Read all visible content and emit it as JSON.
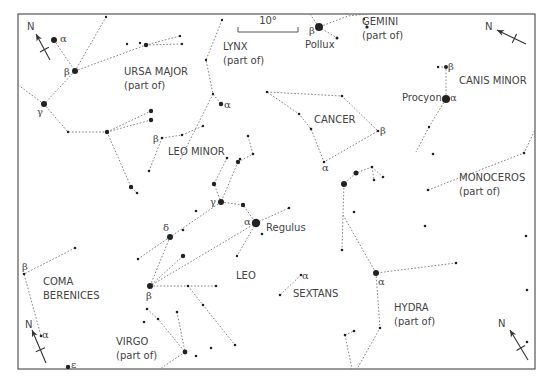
{
  "frame": {
    "x": 18,
    "y": 14,
    "w": 517,
    "h": 355
  },
  "scale_bar": {
    "label": "10°",
    "x1": 238,
    "x2": 298,
    "y": 32
  },
  "compasses": [
    {
      "id": "top-left",
      "label": "N",
      "x1": 50,
      "y1": 60,
      "x2": 36,
      "y2": 34,
      "lx": 27,
      "ly": 30
    },
    {
      "id": "top-right",
      "label": "N",
      "x1": 526,
      "y1": 44,
      "x2": 497,
      "y2": 30,
      "lx": 485,
      "ly": 30
    },
    {
      "id": "bottom-left",
      "label": "N",
      "x1": 46,
      "y1": 363,
      "x2": 32,
      "y2": 330,
      "lx": 25,
      "ly": 328
    },
    {
      "id": "bottom-right",
      "label": "N",
      "x1": 528,
      "y1": 360,
      "x2": 510,
      "y2": 330,
      "lx": 498,
      "ly": 327
    }
  ],
  "constellation_labels": [
    {
      "id": "ursa-major",
      "lines": [
        "URSA MAJOR",
        "(part of)"
      ],
      "x": 124,
      "y": 75
    },
    {
      "id": "lynx",
      "lines": [
        "LYNX",
        "(part of)"
      ],
      "x": 223,
      "y": 50
    },
    {
      "id": "gemini",
      "lines": [
        "GEMINI",
        "(part of)"
      ],
      "x": 362,
      "y": 25
    },
    {
      "id": "canis-minor",
      "lines": [
        "CANIS MINOR"
      ],
      "x": 459,
      "y": 84
    },
    {
      "id": "cancer",
      "lines": [
        "CANCER"
      ],
      "x": 314,
      "y": 123
    },
    {
      "id": "leo-minor",
      "lines": [
        "LEO MINOR"
      ],
      "x": 168,
      "y": 155
    },
    {
      "id": "monoceros",
      "lines": [
        "MONOCEROS",
        "(part of)"
      ],
      "x": 459,
      "y": 181
    },
    {
      "id": "leo",
      "lines": [
        "LEO"
      ],
      "x": 236,
      "y": 279
    },
    {
      "id": "sextans",
      "lines": [
        "SEXTANS"
      ],
      "x": 293,
      "y": 297
    },
    {
      "id": "hydra",
      "lines": [
        "HYDRA",
        "(part of)"
      ],
      "x": 394,
      "y": 311
    },
    {
      "id": "coma-berenices",
      "lines": [
        "COMA",
        "BERENICES"
      ],
      "x": 43,
      "y": 285
    },
    {
      "id": "virgo",
      "lines": [
        "VIRGO",
        "(part of)"
      ],
      "x": 116,
      "y": 345
    }
  ],
  "star_labels": [
    {
      "text": "α",
      "x": 60,
      "y": 42,
      "greek": true
    },
    {
      "text": "β",
      "x": 64,
      "y": 75,
      "greek": true
    },
    {
      "text": "γ",
      "x": 37,
      "y": 115,
      "greek": true
    },
    {
      "text": "β",
      "x": 153,
      "y": 142,
      "greek": true
    },
    {
      "text": "α",
      "x": 224,
      "y": 108,
      "greek": true
    },
    {
      "text": "β",
      "x": 309,
      "y": 34,
      "greek": true
    },
    {
      "text": "Pollux",
      "x": 305,
      "y": 48,
      "greek": false
    },
    {
      "text": "β",
      "x": 448,
      "y": 70,
      "greek": true
    },
    {
      "text": "Procyon",
      "x": 402,
      "y": 101,
      "greek": false
    },
    {
      "text": "α",
      "x": 450,
      "y": 101,
      "greek": true
    },
    {
      "text": "β",
      "x": 380,
      "y": 134,
      "greek": true
    },
    {
      "text": "α",
      "x": 322,
      "y": 171,
      "greek": true
    },
    {
      "text": "γ",
      "x": 210,
      "y": 205,
      "greek": true
    },
    {
      "text": "α",
      "x": 244,
      "y": 225,
      "greek": true
    },
    {
      "text": "Regulus",
      "x": 266,
      "y": 231,
      "greek": false
    },
    {
      "text": "δ",
      "x": 163,
      "y": 231,
      "greek": true
    },
    {
      "text": "β",
      "x": 146,
      "y": 299,
      "greek": true
    },
    {
      "text": "α",
      "x": 302,
      "y": 279,
      "greek": true
    },
    {
      "text": "α",
      "x": 378,
      "y": 285,
      "greek": true
    },
    {
      "text": "β",
      "x": 22,
      "y": 270,
      "greek": true
    },
    {
      "text": "α",
      "x": 42,
      "y": 338,
      "greek": true
    },
    {
      "text": "ε",
      "x": 71,
      "y": 368,
      "greek": true
    }
  ],
  "stars": [
    [
      54,
      40,
      3
    ],
    [
      75,
      71,
      3
    ],
    [
      44,
      104,
      3
    ],
    [
      106,
      17,
      1.2
    ],
    [
      127,
      44,
      1.2
    ],
    [
      140,
      43,
      1.2
    ],
    [
      146,
      45,
      2.2
    ],
    [
      180,
      36,
      1.2
    ],
    [
      182,
      44,
      1.2
    ],
    [
      68,
      132,
      1.2
    ],
    [
      107,
      132,
      2.2
    ],
    [
      151,
      111,
      2.2
    ],
    [
      151,
      120,
      2.2
    ],
    [
      182,
      135,
      1.2
    ],
    [
      162,
      138,
      1.3
    ],
    [
      149,
      171,
      1.3
    ],
    [
      131,
      187,
      2.2
    ],
    [
      137,
      193,
      1.3
    ],
    [
      222,
      20,
      1.2
    ],
    [
      206,
      60,
      1.2
    ],
    [
      213,
      94,
      1.2
    ],
    [
      221,
      104,
      2.2
    ],
    [
      203,
      126,
      1.2
    ],
    [
      319,
      27,
      4
    ],
    [
      337,
      38,
      1.5
    ],
    [
      364,
      19,
      1.2
    ],
    [
      367,
      27,
      1.6
    ],
    [
      438,
      67,
      1.2
    ],
    [
      446,
      67,
      2
    ],
    [
      446,
      99,
      4
    ],
    [
      429,
      127,
      1.2
    ],
    [
      267,
      92,
      1.3
    ],
    [
      342,
      96,
      1.3
    ],
    [
      299,
      114,
      1.3
    ],
    [
      311,
      129,
      1.3
    ],
    [
      378,
      131,
      1.3
    ],
    [
      324,
      162,
      1.3
    ],
    [
      248,
      136,
      1.3
    ],
    [
      253,
      154,
      1.3
    ],
    [
      240,
      159,
      1.3
    ],
    [
      227,
      158,
      1.3
    ],
    [
      238,
      162,
      2.2
    ],
    [
      214,
      184,
      2.2
    ],
    [
      221,
      202,
      3
    ],
    [
      243,
      205,
      2.2
    ],
    [
      256,
      223,
      4.2
    ],
    [
      262,
      234,
      1.3
    ],
    [
      289,
      208,
      1.3
    ],
    [
      196,
      211,
      1.3
    ],
    [
      183,
      230,
      1.3
    ],
    [
      170,
      237,
      3
    ],
    [
      183,
      256,
      2.2
    ],
    [
      138,
      259,
      1.3
    ],
    [
      237,
      256,
      1.2
    ],
    [
      150,
      286,
      3
    ],
    [
      188,
      286,
      1.3
    ],
    [
      216,
      286,
      1.3
    ],
    [
      203,
      305,
      1.3
    ],
    [
      235,
      345,
      1.3
    ],
    [
      301,
      275,
      1.3
    ],
    [
      280,
      295,
      1.3
    ],
    [
      376,
      273,
      3
    ],
    [
      456,
      263,
      1.3
    ],
    [
      380,
      328,
      1.3
    ],
    [
      345,
      335,
      1.3
    ],
    [
      354,
      331,
      1.3
    ],
    [
      344,
      184,
      3
    ],
    [
      356,
      173,
      2.5
    ],
    [
      372,
      167,
      1.3
    ],
    [
      374,
      180,
      1.3
    ],
    [
      383,
      177,
      1.3
    ],
    [
      354,
      212,
      1.3
    ],
    [
      342,
      250,
      1.3
    ],
    [
      428,
      190,
      1.3
    ],
    [
      425,
      226,
      1.3
    ],
    [
      433,
      154,
      1.3
    ],
    [
      524,
      153,
      1.3
    ],
    [
      526,
      236,
      1.3
    ],
    [
      527,
      290,
      1.3
    ],
    [
      527,
      342,
      1.3
    ],
    [
      24,
      274,
      1.3
    ],
    [
      75,
      248,
      1.3
    ],
    [
      41,
      336,
      1.3
    ],
    [
      68,
      367,
      2.2
    ],
    [
      147,
      309,
      1.3
    ],
    [
      158,
      319,
      1.3
    ],
    [
      177,
      312,
      1.3
    ],
    [
      185,
      352,
      2.4
    ],
    [
      211,
      348,
      1.3
    ],
    [
      144,
      322,
      1.3
    ],
    [
      196,
      356,
      1.3
    ]
  ],
  "lines": [
    [
      [
        54,
        40
      ],
      [
        75,
        71
      ]
    ],
    [
      [
        75,
        71
      ],
      [
        106,
        17
      ]
    ],
    [
      [
        75,
        71
      ],
      [
        44,
        104
      ]
    ],
    [
      [
        75,
        71
      ],
      [
        146,
        45
      ],
      [
        180,
        36
      ]
    ],
    [
      [
        146,
        45
      ],
      [
        182,
        44
      ]
    ],
    [
      [
        18,
        85
      ],
      [
        44,
        104
      ]
    ],
    [
      [
        44,
        104
      ],
      [
        68,
        132
      ],
      [
        107,
        132
      ]
    ],
    [
      [
        107,
        132
      ],
      [
        151,
        111
      ]
    ],
    [
      [
        107,
        132
      ],
      [
        151,
        120
      ]
    ],
    [
      [
        107,
        132
      ],
      [
        131,
        187
      ],
      [
        137,
        193
      ]
    ],
    [
      [
        162,
        138
      ],
      [
        182,
        135
      ],
      [
        203,
        126
      ]
    ],
    [
      [
        162,
        138
      ],
      [
        149,
        171
      ]
    ],
    [
      [
        222,
        20
      ],
      [
        206,
        60
      ],
      [
        213,
        94
      ],
      [
        221,
        104
      ]
    ],
    [
      [
        213,
        94
      ],
      [
        180,
        160
      ]
    ],
    [
      [
        310,
        14
      ],
      [
        319,
        27
      ],
      [
        348,
        16
      ],
      [
        367,
        14
      ]
    ],
    [
      [
        319,
        27
      ],
      [
        337,
        38
      ]
    ],
    [
      [
        364,
        19
      ],
      [
        367,
        27
      ]
    ],
    [
      [
        438,
        67
      ],
      [
        446,
        67
      ],
      [
        446,
        99
      ],
      [
        429,
        127
      ]
    ],
    [
      [
        429,
        127
      ],
      [
        416,
        152
      ]
    ],
    [
      [
        267,
        92
      ],
      [
        342,
        96
      ],
      [
        378,
        131
      ],
      [
        324,
        162
      ],
      [
        311,
        129
      ],
      [
        299,
        114
      ],
      [
        267,
        92
      ]
    ],
    [
      [
        248,
        136
      ],
      [
        253,
        154
      ]
    ],
    [
      [
        240,
        159
      ],
      [
        238,
        162
      ],
      [
        253,
        154
      ]
    ],
    [
      [
        227,
        158
      ],
      [
        214,
        184
      ],
      [
        221,
        202
      ]
    ],
    [
      [
        238,
        162
      ],
      [
        221,
        202
      ]
    ],
    [
      [
        221,
        202
      ],
      [
        243,
        205
      ],
      [
        256,
        223
      ]
    ],
    [
      [
        221,
        202
      ],
      [
        170,
        237
      ]
    ],
    [
      [
        256,
        223
      ],
      [
        289,
        208
      ]
    ],
    [
      [
        256,
        223
      ],
      [
        237,
        256
      ]
    ],
    [
      [
        170,
        237
      ],
      [
        138,
        259
      ]
    ],
    [
      [
        170,
        237
      ],
      [
        150,
        286
      ]
    ],
    [
      [
        256,
        223
      ],
      [
        150,
        286
      ]
    ],
    [
      [
        183,
        256
      ],
      [
        150,
        286
      ]
    ],
    [
      [
        150,
        286
      ],
      [
        216,
        286
      ]
    ],
    [
      [
        188,
        286
      ],
      [
        203,
        305
      ],
      [
        235,
        345
      ]
    ],
    [
      [
        301,
        275
      ],
      [
        280,
        295
      ]
    ],
    [
      [
        372,
        167
      ],
      [
        356,
        173
      ],
      [
        344,
        184
      ],
      [
        343,
        215
      ],
      [
        342,
        250
      ]
    ],
    [
      [
        372,
        167
      ],
      [
        374,
        180
      ]
    ],
    [
      [
        372,
        167
      ],
      [
        383,
        177
      ]
    ],
    [
      [
        343,
        215
      ],
      [
        376,
        273
      ],
      [
        456,
        263
      ]
    ],
    [
      [
        376,
        273
      ],
      [
        380,
        328
      ],
      [
        357,
        369
      ]
    ],
    [
      [
        345,
        335
      ],
      [
        354,
        331
      ]
    ],
    [
      [
        345,
        335
      ],
      [
        352,
        369
      ]
    ],
    [
      [
        428,
        190
      ],
      [
        524,
        153
      ],
      [
        535,
        130
      ]
    ],
    [
      [
        75,
        248
      ],
      [
        24,
        274
      ],
      [
        41,
        336
      ]
    ],
    [
      [
        147,
        309
      ],
      [
        158,
        319
      ],
      [
        185,
        352
      ]
    ],
    [
      [
        177,
        312
      ],
      [
        185,
        352
      ]
    ],
    [
      [
        185,
        352
      ],
      [
        160,
        369
      ]
    ]
  ]
}
